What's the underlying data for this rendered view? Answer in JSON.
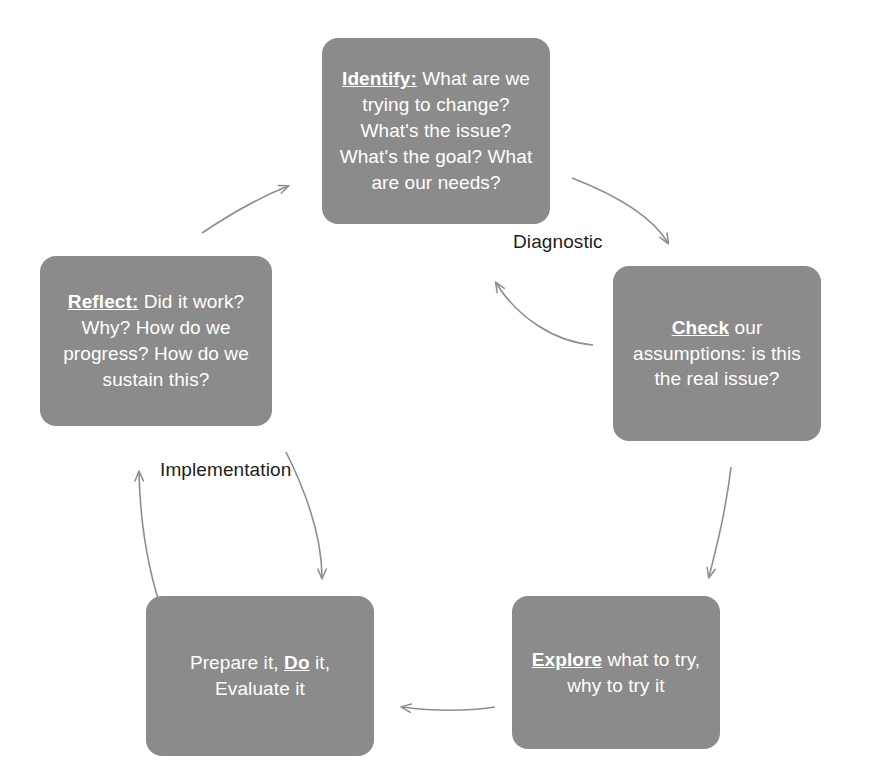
{
  "diagram": {
    "type": "cycle-diagram",
    "colors": {
      "node_fill": "#8b8b8b",
      "node_text": "#ffffff",
      "arrow": "#8d8d8d",
      "label_text": "#1d1d1d",
      "background": "#ffffff"
    },
    "nodes": [
      {
        "id": "identify",
        "keyword": "Identify:",
        "rest": " What are we trying to change? What's the issue? What's the goal? What are our needs?",
        "full_text": "Identify: What are we trying to change? What's the issue? What's the goal? What are our needs?"
      },
      {
        "id": "check",
        "keyword": "Check",
        "rest": " our assumptions: is this the real issue?",
        "full_text": "Check our assumptions: is this the real issue?"
      },
      {
        "id": "explore",
        "keyword": "Explore",
        "rest": " what to try, why to try it",
        "full_text": "Explore what to try, why to try it"
      },
      {
        "id": "do",
        "prefix": "Prepare it, ",
        "keyword": "Do",
        "rest": " it, Evaluate it",
        "full_text": "Prepare it, Do it, Evaluate it"
      },
      {
        "id": "reflect",
        "keyword": "Reflect:",
        "rest": " Did it work? Why? How do we progress? How do we sustain this?",
        "full_text": "Reflect: Did it work? Why? How do we progress? How do we sustain this?"
      }
    ],
    "phase_labels": [
      {
        "id": "diagnostic",
        "text": "Diagnostic"
      },
      {
        "id": "implementation",
        "text": "Implementation"
      }
    ],
    "arrows": [
      {
        "id": "identify-to-check",
        "from": "identify",
        "to": "check"
      },
      {
        "id": "check-to-identify",
        "from": "check",
        "to": "identify"
      },
      {
        "id": "check-to-explore",
        "from": "check",
        "to": "explore"
      },
      {
        "id": "explore-to-do",
        "from": "explore",
        "to": "do"
      },
      {
        "id": "do-to-reflect",
        "from": "do",
        "to": "reflect"
      },
      {
        "id": "reflect-to-do",
        "from": "reflect",
        "to": "do"
      },
      {
        "id": "reflect-to-identify",
        "from": "reflect",
        "to": "identify"
      }
    ]
  }
}
